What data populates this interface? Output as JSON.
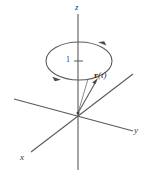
{
  "figure": {
    "width": 153,
    "height": 174,
    "background_color": "#ffffff",
    "stroke_color": "#555555",
    "text_color": "#3a3a3a"
  },
  "axes": {
    "z": {
      "label": "z",
      "label_x": 76,
      "label_y": 5,
      "x1": 78,
      "y1": 14,
      "x2": 78,
      "y2": 170
    },
    "y": {
      "label": "y",
      "label_x": 135,
      "label_y": 128,
      "x1": 14,
      "y1": 99,
      "x2": 133,
      "y2": 131
    },
    "x": {
      "label": "x",
      "label_x": 21,
      "label_y": 155,
      "x1": 133,
      "y1": 74,
      "x2": 31,
      "y2": 152
    },
    "origin_x": 78,
    "origin_y": 113
  },
  "circle": {
    "name": "unit-circle-path",
    "center_x": 79,
    "center_y": 61,
    "radius_x": 33,
    "radius_y": 19,
    "direction": "counterclockwise"
  },
  "tick": {
    "label": "1",
    "label_x": 67,
    "label_y": 57,
    "mark_x1": 74,
    "mark_y1": 61,
    "mark_x2": 82,
    "mark_y2": 61
  },
  "vector": {
    "label_bold": "r",
    "label_rest": "(t)",
    "label_x": 95,
    "label_y": 73,
    "tail_x": 78,
    "tail_y": 113,
    "head_x": 97,
    "head_y": 80
  },
  "arrows": [
    {
      "name": "circle-arrow-top-right",
      "x": 104,
      "y": 44
    },
    {
      "name": "circle-arrow-bottom-left",
      "x": 56,
      "y": 78
    }
  ]
}
